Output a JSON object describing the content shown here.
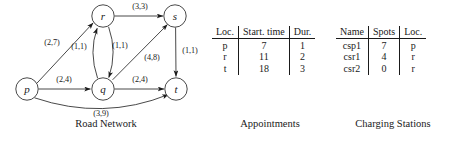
{
  "figure": {
    "panels": {
      "road_network": {
        "caption": "Road Network"
      },
      "appointments": {
        "caption": "Appointments"
      },
      "charging_stations": {
        "caption": "Charging Stations"
      }
    }
  },
  "graph": {
    "nodes": [
      {
        "id": "p",
        "label": "p",
        "cx": 27,
        "cy": 89
      },
      {
        "id": "q",
        "label": "q",
        "cx": 103,
        "cy": 89
      },
      {
        "id": "r",
        "label": "r",
        "cx": 103,
        "cy": 16
      },
      {
        "id": "s",
        "label": "s",
        "cx": 175,
        "cy": 16
      },
      {
        "id": "t",
        "label": "t",
        "cx": 176,
        "cy": 89
      }
    ],
    "edges": [
      {
        "from": "p",
        "to": "r",
        "label": "(2,7)",
        "lx": 52,
        "ly": 45
      },
      {
        "from": "p",
        "to": "q",
        "label": "(2,4)",
        "lx": 64,
        "ly": 82
      },
      {
        "from": "p",
        "to": "t",
        "label": "(3,9)",
        "lx": 101,
        "ly": 116
      },
      {
        "from": "q",
        "to": "r",
        "label": "(1,1)",
        "lx": 79,
        "ly": 49
      },
      {
        "from": "r",
        "to": "q",
        "label": "(1,1)",
        "lx": 118,
        "ly": 48
      },
      {
        "from": "r",
        "to": "s",
        "label": "(3,3)",
        "lx": 140,
        "ly": 8
      },
      {
        "from": "q",
        "to": "s",
        "label": "(4,8)",
        "lx": 150,
        "ly": 59
      },
      {
        "from": "q",
        "to": "t",
        "label": "(2,4)",
        "lx": 140,
        "ly": 82
      },
      {
        "from": "s",
        "to": "t",
        "label": "(1,1)",
        "lx": 190,
        "ly": 52
      }
    ]
  },
  "appointments_table": {
    "headers": [
      "Loc.",
      "Start. time",
      "Dur."
    ],
    "rows": [
      [
        "p",
        "7",
        "1"
      ],
      [
        "r",
        "11",
        "2"
      ],
      [
        "t",
        "18",
        "3"
      ]
    ]
  },
  "charging_stations_table": {
    "headers": [
      "Name",
      "Spots",
      "Loc."
    ],
    "rows": [
      [
        "csp1",
        "7",
        "p"
      ],
      [
        "csr1",
        "4",
        "r"
      ],
      [
        "csr2",
        "0",
        "r"
      ]
    ]
  }
}
